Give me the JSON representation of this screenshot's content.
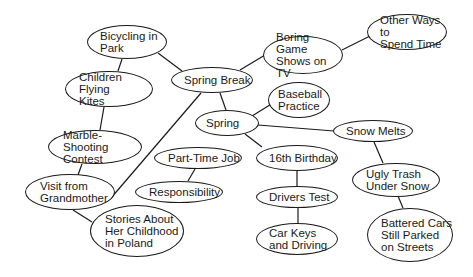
{
  "diagram": {
    "type": "concept-map",
    "nodes": [
      {
        "id": "bicycling",
        "label": "Bicycling in\nPark",
        "cx": 127,
        "cy": 42,
        "rx": 40,
        "ry": 17
      },
      {
        "id": "spring_break",
        "label": "Spring Break",
        "cx": 212,
        "cy": 80,
        "rx": 41,
        "ry": 13
      },
      {
        "id": "boring_game",
        "label": "Boring Game\nShows on TV",
        "cx": 303,
        "cy": 55,
        "rx": 40,
        "ry": 19
      },
      {
        "id": "other_ways",
        "label": "Other Ways to\nSpend Time",
        "cx": 407,
        "cy": 32,
        "rx": 40,
        "ry": 18
      },
      {
        "id": "children_kites",
        "label": "Children Flying\nKites",
        "cx": 109,
        "cy": 89,
        "rx": 44,
        "ry": 18
      },
      {
        "id": "baseball",
        "label": "Baseball\nPractice",
        "cx": 299,
        "cy": 100,
        "rx": 31,
        "ry": 18
      },
      {
        "id": "spring",
        "label": "Spring",
        "cx": 227,
        "cy": 123,
        "rx": 32,
        "ry": 13
      },
      {
        "id": "snow_melts",
        "label": "Snow Melts",
        "cx": 373,
        "cy": 131,
        "rx": 40,
        "ry": 11
      },
      {
        "id": "marble",
        "label": "Marble-Shooting\nContest",
        "cx": 95,
        "cy": 147,
        "rx": 47,
        "ry": 17
      },
      {
        "id": "part_time",
        "label": "Part-Time Job",
        "cx": 198,
        "cy": 158,
        "rx": 44,
        "ry": 11
      },
      {
        "id": "birthday",
        "label": "16th Birthday",
        "cx": 297,
        "cy": 158,
        "rx": 41,
        "ry": 13
      },
      {
        "id": "grandmother",
        "label": "Visit from\nGrandmother",
        "cx": 70,
        "cy": 192,
        "rx": 45,
        "ry": 18
      },
      {
        "id": "responsibility",
        "label": "Responsibility",
        "cx": 179,
        "cy": 192,
        "rx": 44,
        "ry": 11
      },
      {
        "id": "ugly_trash",
        "label": "Ugly Trash\nUnder Snow",
        "cx": 396,
        "cy": 180,
        "rx": 44,
        "ry": 17
      },
      {
        "id": "drivers_test",
        "label": "Drivers Test",
        "cx": 297,
        "cy": 197,
        "rx": 41,
        "ry": 11
      },
      {
        "id": "stories",
        "label": "Stories About\nHer Childhood\nin Poland",
        "cx": 137,
        "cy": 231,
        "rx": 47,
        "ry": 26
      },
      {
        "id": "car_keys",
        "label": "Car Keys\nand Driving",
        "cx": 297,
        "cy": 239,
        "rx": 41,
        "ry": 16
      },
      {
        "id": "battered",
        "label": "Battered Cars\nStill Parked\non Streets",
        "cx": 410,
        "cy": 235,
        "rx": 43,
        "ry": 27
      }
    ],
    "edges": [
      {
        "from": "bicycling",
        "to": "spring_break",
        "x1": 158,
        "y1": 53,
        "x2": 182,
        "y2": 71
      },
      {
        "from": "bicycling",
        "to": "children_kites",
        "x1": 122,
        "y1": 59,
        "x2": 118,
        "y2": 71
      },
      {
        "from": "children_kites",
        "to": "marble",
        "x1": 104,
        "y1": 107,
        "x2": 100,
        "y2": 130
      },
      {
        "from": "marble",
        "to": "grandmother",
        "x1": 82,
        "y1": 164,
        "x2": 78,
        "y2": 175
      },
      {
        "from": "grandmother",
        "to": "stories",
        "x1": 73,
        "y1": 210,
        "x2": 92,
        "y2": 222
      },
      {
        "from": "grandmother",
        "to": "spring_break",
        "x1": 111,
        "y1": 198,
        "x2": 201,
        "y2": 93
      },
      {
        "from": "spring_break",
        "to": "boring_game",
        "x1": 240,
        "y1": 70,
        "x2": 265,
        "y2": 55
      },
      {
        "from": "boring_game",
        "to": "other_ways",
        "x1": 342,
        "y1": 50,
        "x2": 370,
        "y2": 36
      },
      {
        "from": "spring_break",
        "to": "spring",
        "x1": 220,
        "y1": 93,
        "x2": 226,
        "y2": 110
      },
      {
        "from": "spring",
        "to": "baseball",
        "x1": 252,
        "y1": 116,
        "x2": 273,
        "y2": 103
      },
      {
        "from": "spring",
        "to": "snow_melts",
        "x1": 258,
        "y1": 125,
        "x2": 334,
        "y2": 131
      },
      {
        "from": "spring",
        "to": "birthday",
        "x1": 245,
        "y1": 134,
        "x2": 262,
        "y2": 147
      },
      {
        "from": "birthday",
        "to": "drivers_test",
        "x1": 297,
        "y1": 171,
        "x2": 297,
        "y2": 186
      },
      {
        "from": "drivers_test",
        "to": "car_keys",
        "x1": 298,
        "y1": 208,
        "x2": 298,
        "y2": 223
      },
      {
        "from": "snow_melts",
        "to": "ugly_trash",
        "x1": 374,
        "y1": 142,
        "x2": 383,
        "y2": 163
      },
      {
        "from": "ugly_trash",
        "to": "battered",
        "x1": 398,
        "y1": 196,
        "x2": 403,
        "y2": 208
      },
      {
        "from": "part_time",
        "to": "responsibility",
        "x1": 195,
        "y1": 169,
        "x2": 188,
        "y2": 181
      }
    ]
  },
  "colors": {
    "stroke": "#1a1a1a",
    "background": "#ffffff",
    "text": "#1a1a1a"
  }
}
